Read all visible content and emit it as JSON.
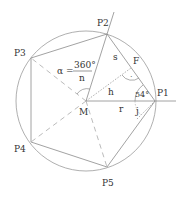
{
  "diagram": {
    "points": {
      "P1": "P1",
      "P2": "P2",
      "P3": "P3",
      "P4": "P4",
      "P5": "P5",
      "M": "M",
      "F": "F"
    },
    "segments": {
      "s": "s",
      "h": "h",
      "r": "r",
      "j": "j"
    },
    "angle_label": "54°",
    "right_angle_mark": "·",
    "alpha": {
      "symbol": "α =",
      "numerator": "360°",
      "denominator": "n"
    },
    "colors": {
      "stroke": "#8a8a8a",
      "text": "#333333"
    }
  }
}
